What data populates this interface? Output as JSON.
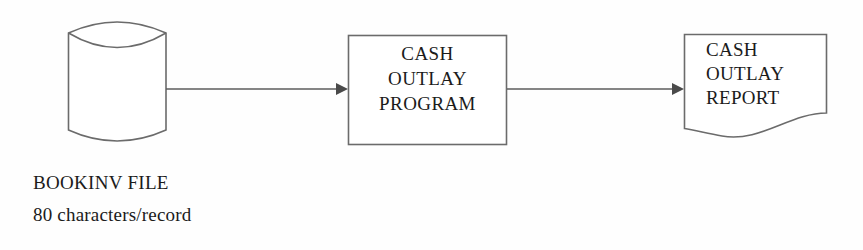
{
  "diagram": {
    "background_color": "#fefefe",
    "stroke_color": "#6b6b6b",
    "text_color": "#1b1b1b",
    "nodes": [
      {
        "id": "bookinv-file",
        "shape": "cylinder",
        "symbol_meaning": "magnetic-disk-storage",
        "caption_line1": "BOOKINV FILE",
        "caption_line2": "80 characters/record"
      },
      {
        "id": "cash-outlay-program",
        "shape": "rectangle",
        "symbol_meaning": "process",
        "line1": "CASH",
        "line2": "OUTLAY",
        "line3": "PROGRAM"
      },
      {
        "id": "cash-outlay-report",
        "shape": "document",
        "symbol_meaning": "printed-document-output",
        "line1": "CASH",
        "line2": "OUTLAY",
        "line3": "REPORT"
      }
    ],
    "connectors": [
      {
        "id": "file-to-program",
        "from": "bookinv-file",
        "to": "cash-outlay-program",
        "arrow": "right"
      },
      {
        "id": "program-to-report",
        "from": "cash-outlay-program",
        "to": "cash-outlay-report",
        "arrow": "right"
      }
    ]
  }
}
